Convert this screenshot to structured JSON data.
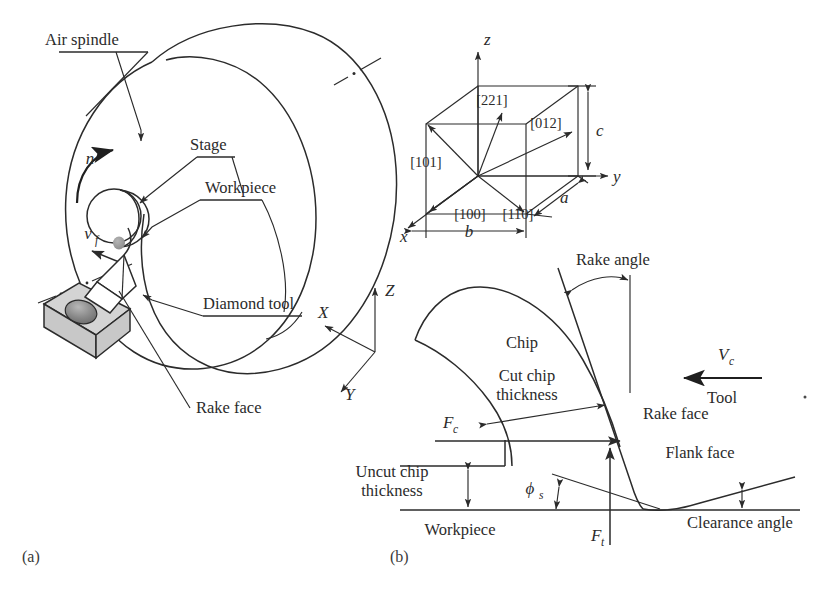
{
  "figure": {
    "panel_a": {
      "caption": "(a)",
      "labels": {
        "air_spindle": "Air spindle",
        "stage": "Stage",
        "workpiece": "Workpiece",
        "diamond_tool": "Diamond tool",
        "rake_face": "Rake face",
        "rotation_symbol": "n",
        "feed_symbol": "v",
        "feed_subscript": "f"
      },
      "axes": {
        "x": "X",
        "y": "Y",
        "z": "Z"
      }
    },
    "panel_crystal": {
      "axes": {
        "x": "x",
        "y": "y",
        "z": "z"
      },
      "dimensions": {
        "a": "a",
        "b": "b",
        "c": "c"
      },
      "directions": [
        "[221]",
        "[012]",
        "[101]",
        "[100]",
        "[110]"
      ]
    },
    "panel_b": {
      "caption": "(b)",
      "labels": {
        "rake_angle": "Rake angle",
        "chip": "Chip",
        "cut_chip_thickness_line1": "Cut chip",
        "cut_chip_thickness_line2": "thickness",
        "uncut_chip_thickness_line1": "Uncut chip",
        "uncut_chip_thickness_line2": "thickness",
        "rake_face": "Rake face",
        "flank_face": "Flank face",
        "clearance_angle": "Clearance angle",
        "workpiece": "Workpiece",
        "tool": "Tool",
        "cutting_speed_symbol": "V",
        "cutting_speed_subscript": "c",
        "cutting_force_symbol": "F",
        "cutting_force_subscript": "c",
        "thrust_force_symbol": "F",
        "thrust_force_subscript": "t",
        "shear_angle_symbol": "ϕ",
        "shear_angle_subscript": "s"
      }
    },
    "colors": {
      "ink": "#2b2b2b",
      "tool_body": "#d4d4d4",
      "tool_hole": "#8f8f8f",
      "background": "#ffffff"
    }
  }
}
